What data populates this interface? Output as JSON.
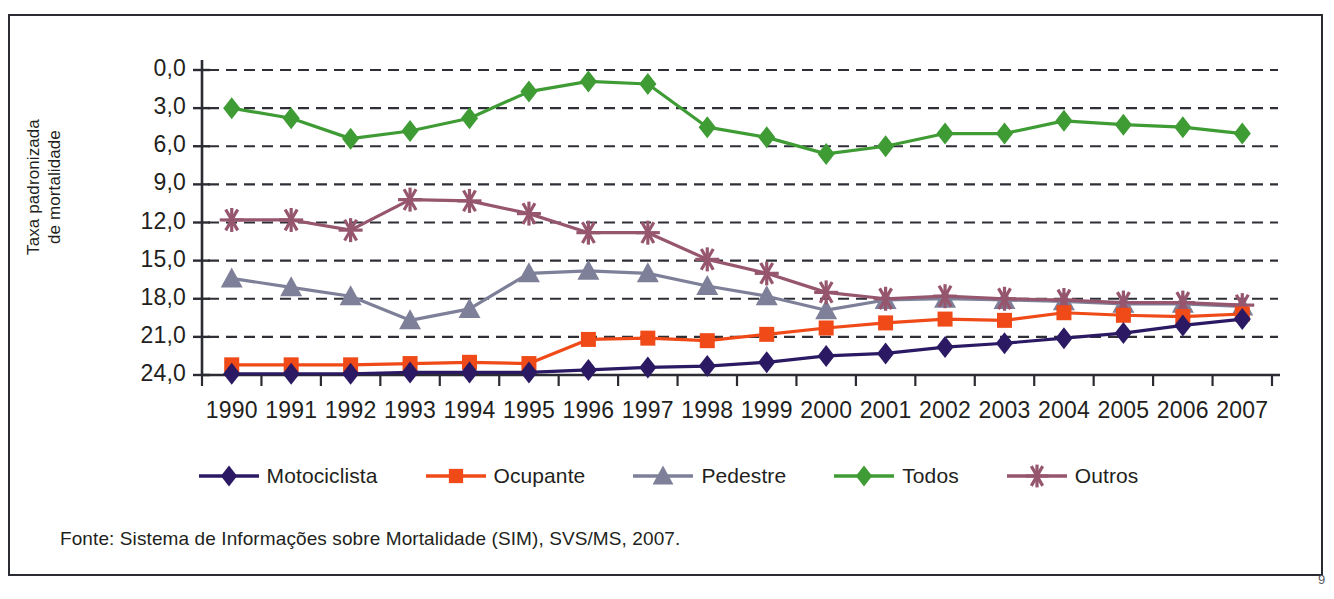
{
  "figure": {
    "source_note": "Fonte: Sistema de Informações sobre Mortalidade (SIM), SVS/MS, 2007.",
    "corner_mark": "9"
  },
  "axes": {
    "y_title_line1": "Taxa padronizada",
    "y_title_line2": "de mortalidade",
    "y_title": "Taxa padronizada de mortalidade",
    "y_ticks": [
      "24,0",
      "21,0",
      "18,0",
      "15,0",
      "12,0",
      "9,0",
      "6,0",
      "3,0",
      "0,0"
    ],
    "x_ticks": [
      "1990",
      "1991",
      "1992",
      "1993",
      "1994",
      "1995",
      "1996",
      "1997",
      "1998",
      "1999",
      "2000",
      "2001",
      "2002",
      "2003",
      "2004",
      "2005",
      "2006",
      "2007"
    ]
  },
  "legend": {
    "items": [
      {
        "label": "Motociclista",
        "color": "#2b1a63",
        "marker": "diamond"
      },
      {
        "label": "Ocupante",
        "color": "#ef4a18",
        "marker": "square"
      },
      {
        "label": "Pedestre",
        "color": "#7d8098",
        "marker": "triangle"
      },
      {
        "label": "Todos",
        "color": "#3f9c35",
        "marker": "diamond"
      },
      {
        "label": "Outros",
        "color": "#96566e",
        "marker": "asterisk"
      }
    ]
  },
  "chart_data": {
    "type": "line",
    "title": "",
    "xlabel": "",
    "ylabel": "Taxa padronizada de mortalidade",
    "categories": [
      "1990",
      "1991",
      "1992",
      "1993",
      "1994",
      "1995",
      "1996",
      "1997",
      "1998",
      "1999",
      "2000",
      "2001",
      "2002",
      "2003",
      "2004",
      "2005",
      "2006",
      "2007"
    ],
    "ylim": [
      0,
      24
    ],
    "ytick_values": [
      0,
      3,
      6,
      9,
      12,
      15,
      18,
      21,
      24
    ],
    "grid": "horizontal-dashed",
    "legend_position": "bottom",
    "series": [
      {
        "name": "Motociclista",
        "color": "#2b1a63",
        "marker": "diamond",
        "values": [
          0.1,
          0.1,
          0.1,
          0.2,
          0.2,
          0.2,
          0.4,
          0.6,
          0.7,
          1.0,
          1.5,
          1.7,
          2.2,
          2.5,
          2.9,
          3.3,
          3.9,
          4.4
        ]
      },
      {
        "name": "Ocupante",
        "color": "#ef4a18",
        "marker": "square",
        "values": [
          0.8,
          0.8,
          0.8,
          0.9,
          1.0,
          0.9,
          2.8,
          2.9,
          2.7,
          3.2,
          3.7,
          4.1,
          4.4,
          4.3,
          4.9,
          4.7,
          4.6,
          4.8
        ]
      },
      {
        "name": "Pedestre",
        "color": "#7d8098",
        "marker": "triangle",
        "values": [
          7.6,
          6.9,
          6.2,
          4.3,
          5.2,
          8.0,
          8.2,
          8.0,
          7.0,
          6.2,
          5.1,
          5.9,
          6.0,
          5.9,
          5.8,
          5.6,
          5.6,
          5.4
        ]
      },
      {
        "name": "Todos",
        "color": "#3f9c35",
        "marker": "diamond",
        "values": [
          21.0,
          20.2,
          18.6,
          19.2,
          20.2,
          22.3,
          23.1,
          22.9,
          19.5,
          18.7,
          17.4,
          18.0,
          19.0,
          19.0,
          20.0,
          19.7,
          19.5,
          19.0
        ]
      },
      {
        "name": "Outros",
        "color": "#96566e",
        "marker": "asterisk",
        "values": [
          12.2,
          12.2,
          11.4,
          13.8,
          13.7,
          12.7,
          11.2,
          11.2,
          9.1,
          8.0,
          6.5,
          6.0,
          6.2,
          6.0,
          5.9,
          5.7,
          5.7,
          5.5
        ]
      }
    ]
  }
}
